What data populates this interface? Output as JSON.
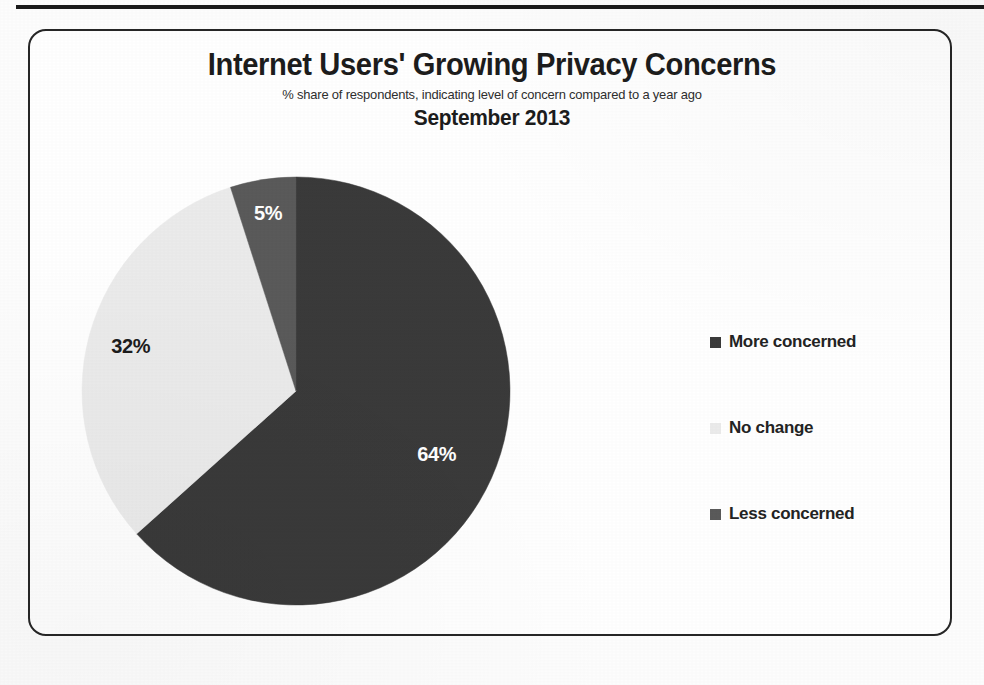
{
  "header": {
    "title": "Internet Users' Growing Privacy Concerns",
    "subtitle": "% share of respondents, indicating level of concern compared to a year ago",
    "period": "September 2013"
  },
  "colors": {
    "more_concerned": "#3a3a3a",
    "no_change": "#ebebeb",
    "less_concerned": "#5a5a5a",
    "frame": "#262626",
    "rule": "#1a1a1a",
    "label_light": "#ffffff",
    "label_dark": "#1c1c1c",
    "background": "#ffffff"
  },
  "legend": {
    "position": "right",
    "items": [
      {
        "label": "More concerned",
        "color": "#3a3a3a",
        "swatch": "square-marker"
      },
      {
        "label": "No change",
        "color": "#ebebeb",
        "swatch": "square-marker"
      },
      {
        "label": "Less concerned",
        "color": "#5a5a5a",
        "swatch": "square-marker"
      }
    ]
  },
  "slice_labels": {
    "more_concerned": "64%",
    "no_change": "32%",
    "less_concerned": "5%"
  },
  "chart_data": {
    "type": "pie",
    "title": "Internet Users' Growing Privacy Concerns",
    "subtitle": "% share of respondents, indicating level of concern compared to a year ago",
    "period": "September 2013",
    "unit": "% share of respondents",
    "categories": [
      "More concerned",
      "No change",
      "Less concerned"
    ],
    "values": [
      64,
      32,
      5
    ],
    "data_labels": [
      "64%",
      "32%",
      "5%"
    ],
    "colors": [
      "#3a3a3a",
      "#ebebeb",
      "#5a5a5a"
    ],
    "start_angle_deg": 0,
    "direction": "clockwise",
    "legend": "right",
    "grid": false,
    "xlabel": "",
    "ylabel": ""
  }
}
